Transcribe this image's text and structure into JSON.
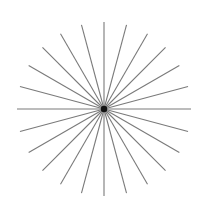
{
  "figure": {
    "type": "starburst",
    "center": {
      "x": 104,
      "y": 109
    },
    "radius": 87,
    "ray_count": 24,
    "angle_step_deg": 15,
    "line_color": "#7a7a7a",
    "line_width": 1.1,
    "center_dot_color": "#111111",
    "center_dot_radius": 3.2,
    "background": "#ffffff"
  }
}
